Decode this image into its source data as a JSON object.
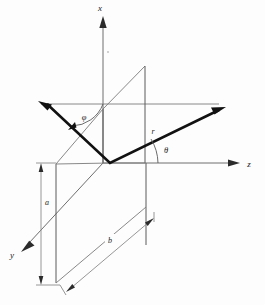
{
  "figure": {
    "background_color": "#fdfdfd",
    "line_color": "#111111",
    "thin_line_color": "#7a7a7a",
    "axis_color": "#6e6e6e"
  },
  "axes": [
    {
      "name": "x-axis",
      "label": "x",
      "direction": "up",
      "label_x": 100,
      "label_y": 11
    },
    {
      "name": "y-axis",
      "label": "y",
      "direction": "lower-left",
      "label_x": 12,
      "label_y": 258
    },
    {
      "name": "z-axis",
      "label": "z",
      "direction": "right",
      "label_x": 249,
      "label_y": 167
    }
  ],
  "annotations": [
    {
      "name": "radius-vector-label",
      "label": "r",
      "x": 153,
      "y": 134
    },
    {
      "name": "theta-angle-label",
      "label": "θ",
      "x": 163,
      "y": 152
    },
    {
      "name": "phi-angle-label",
      "label": "φ",
      "x": 82,
      "y": 120
    },
    {
      "name": "dimension-a-label",
      "label": "a",
      "x": 47,
      "y": 203
    },
    {
      "name": "dimension-b-label",
      "label": "b",
      "x": 110,
      "y": 242
    }
  ],
  "geometry": {
    "origin": {
      "x": 103,
      "y": 109
    },
    "vector_r_tip": {
      "x": 219,
      "y": 110
    },
    "vector_y_tip": {
      "x": 41,
      "y": 104
    },
    "foot_point": {
      "x": 110,
      "y": 163
    },
    "upper_plane_corner": {
      "x": 145,
      "y": 66
    },
    "lower_plane_corner": {
      "x": 146,
      "y": 207
    }
  }
}
